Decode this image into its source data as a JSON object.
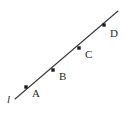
{
  "figure": {
    "background_color": "#ffffff",
    "width": 125,
    "height": 115
  },
  "chart_data": {
    "type": "scatter",
    "title": "",
    "xlabel": "",
    "ylabel": "",
    "grid": false,
    "legend": false,
    "xlim": [
      0,
      125
    ],
    "ylim": [
      0,
      115
    ],
    "line": {
      "name": "l",
      "label": "l",
      "color": "#3a3a3a",
      "width": 1.1,
      "x1": 15,
      "y1": 99,
      "x2": 118,
      "y2": 11,
      "label_x": 7,
      "label_y": 94
    },
    "points": [
      {
        "name": "A",
        "label": "A",
        "x": 26,
        "y": 87,
        "label_x": 32,
        "label_y": 88
      },
      {
        "name": "B",
        "label": "B",
        "x": 53,
        "y": 70,
        "label_x": 59,
        "label_y": 71
      },
      {
        "name": "C",
        "label": "C",
        "x": 79,
        "y": 48,
        "label_x": 85,
        "label_y": 49
      },
      {
        "name": "D",
        "label": "D",
        "x": 104,
        "y": 25,
        "label_x": 110,
        "label_y": 28
      }
    ],
    "marker": {
      "shape": "square",
      "size": 3.4,
      "color": "#1c1c1c"
    }
  }
}
